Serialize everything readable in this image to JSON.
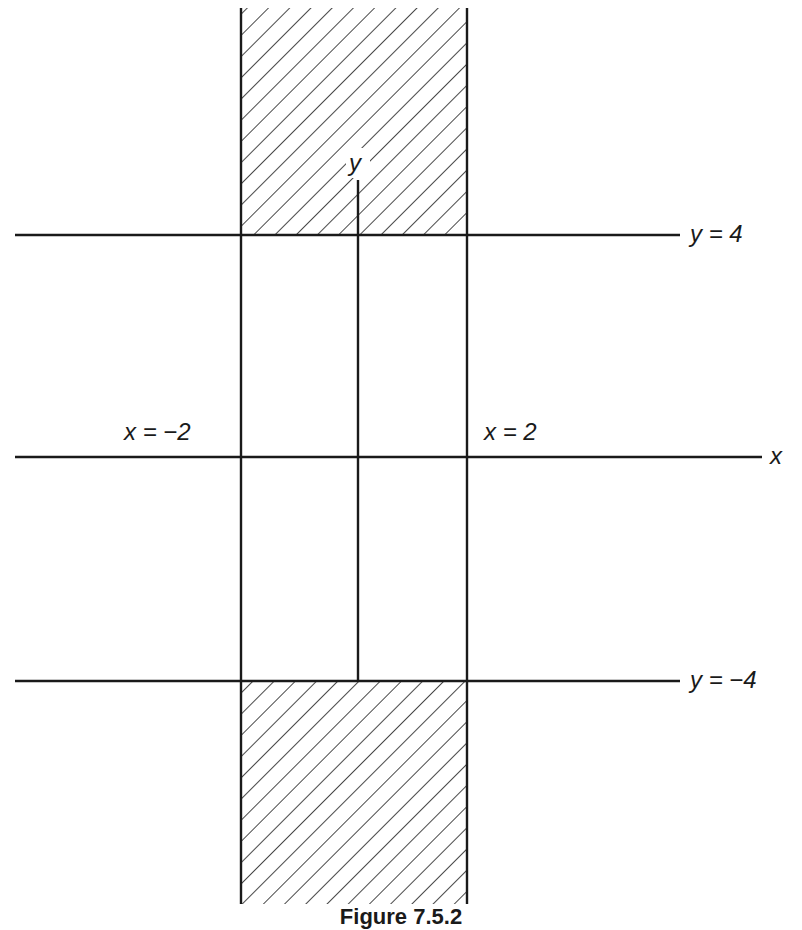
{
  "figure": {
    "caption": "Figure 7.5.2",
    "axes": {
      "x_label": "x",
      "y_label": "y"
    },
    "lines": [
      {
        "id": "y4",
        "label": "y = 4"
      },
      {
        "id": "yneg4",
        "label": "y = −4"
      },
      {
        "id": "xneg2",
        "label": "x = −2"
      },
      {
        "id": "x2",
        "label": "x = 2"
      }
    ],
    "shaded_regions": [
      {
        "description": "between x = −2 and x = 2, above y = 4"
      },
      {
        "description": "between x = −2 and x = 2, below y = −4"
      }
    ],
    "colors": {
      "ink": "#1a1a1a",
      "background": "#ffffff"
    }
  }
}
